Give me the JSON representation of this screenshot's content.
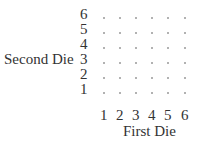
{
  "y_axis": {
    "label": "Second Die",
    "ticks": [
      "6",
      "5",
      "4",
      "3",
      "2",
      "1"
    ]
  },
  "x_axis": {
    "label": "First Die",
    "ticks": [
      "1",
      "2",
      "3",
      "4",
      "5",
      "6"
    ]
  },
  "grid": {
    "rows": 6,
    "cols": 6,
    "marker": "."
  }
}
